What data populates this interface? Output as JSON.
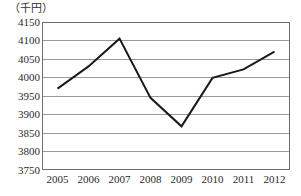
{
  "chart_data": {
    "type": "line",
    "title": "",
    "subtitle": "",
    "unit_label": "（千円）",
    "xlabel": "",
    "ylabel": "",
    "categories": [
      "2005",
      "2006",
      "2007",
      "2008",
      "2009",
      "2010",
      "2011",
      "2012"
    ],
    "values": [
      3970,
      4030,
      4105,
      3945,
      3868,
      3999,
      4022,
      4070
    ],
    "series": [
      {
        "name": "",
        "values": [
          3970,
          4030,
          4105,
          3945,
          3868,
          3999,
          4022,
          4070
        ]
      }
    ],
    "ylim": [
      3750,
      4150
    ],
    "yticks": [
      3750,
      3800,
      3850,
      3900,
      3950,
      4000,
      4050,
      4100,
      4150
    ],
    "ytick_labels": [
      "3750",
      "3800",
      "3850",
      "3900",
      "3950",
      "4000",
      "4050",
      "4100",
      "4150"
    ],
    "xtick_labels": [
      "2005",
      "2006",
      "2007",
      "2008",
      "2009",
      "2010",
      "2011",
      "2012"
    ],
    "grid": true,
    "grid_axis": "y",
    "legend": false,
    "legend_position": "none",
    "line_color": "#1a1a1a",
    "grid_color": "#9a9a9a",
    "frame_color": "#6f6f6f",
    "background_color": "#ffffff",
    "text_color": "#2b2b2b",
    "markers": false,
    "line_width": 2
  }
}
